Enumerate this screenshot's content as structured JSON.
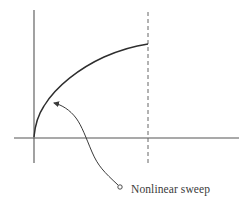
{
  "diagram": {
    "annotation": {
      "label": "Nonlinear sweep"
    },
    "colors": {
      "stroke": "#3a3a3a",
      "background": "#ffffff"
    }
  }
}
